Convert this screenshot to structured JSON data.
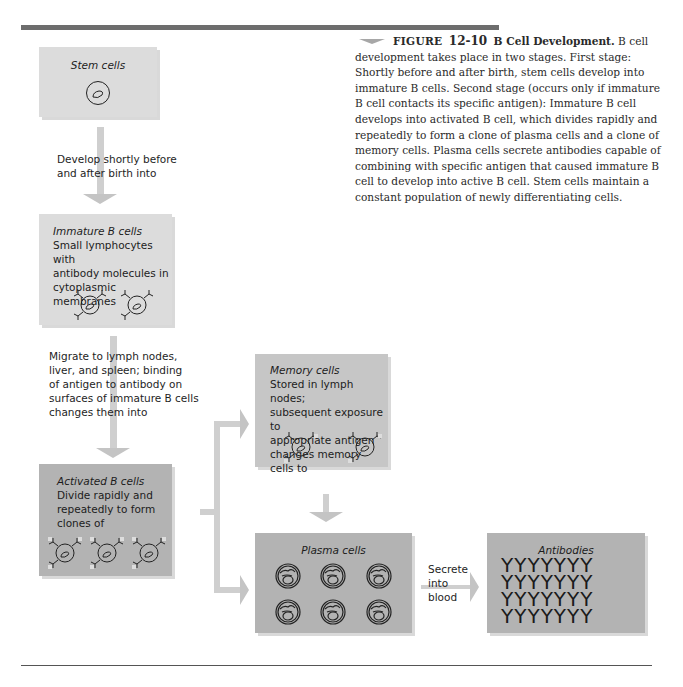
{
  "caption": {
    "figure_label": "FIGURE",
    "figure_number": "12-10",
    "title": "B Cell Development.",
    "body": "B cell development takes place in two stages. First stage: Shortly before and after birth, stem cells develop into immature B cells. Second stage (occurs only if immature B cell contacts its specific antigen): Immature B cell develops into activated B cell, which divides rapidly and repeatedly to form a clone of plasma cells and a clone of memory cells. Plasma cells secrete antibodies capable of combining with specific antigen that caused immature B cell to develop into active B cell. Stem cells maintain a constant population of newly differentiating cells."
  },
  "boxes": {
    "stem": {
      "title": "Stem cells",
      "icon": "stem-cell-icon"
    },
    "immature": {
      "title": "Immature B cells",
      "lines": [
        "Small lymphocytes with",
        "antibody molecules in",
        "cytoplasmic membranes"
      ],
      "icon": "immature-b-cell-icon",
      "icon_count": 2
    },
    "activated": {
      "title": "Activated B cells",
      "lines": [
        "Divide rapidly and",
        "repeatedly to form",
        "clones of"
      ],
      "icon": "activated-b-cell-icon",
      "icon_count": 3
    },
    "memory": {
      "title": "Memory cells",
      "lines": [
        "Stored in lymph nodes;",
        "subsequent exposure to",
        "appropriate antigen",
        "changes memory cells to"
      ],
      "icon": "memory-cell-icon",
      "icon_count": 2
    },
    "plasma": {
      "title": "Plasma cells",
      "icon": "plasma-cell-icon",
      "icon_count": 6
    },
    "antibodies": {
      "title": "Antibodies",
      "rows": [
        "YYYYYYY",
        "YYYYYYY",
        "YYYYYYY",
        "YYYYYYY"
      ],
      "icon": "antibody-icon"
    }
  },
  "transitions": {
    "stem_to_immature": [
      "Develop shortly before",
      "and after birth into"
    ],
    "immature_to_activated": [
      "Migrate to lymph nodes,",
      "liver, and spleen; binding",
      "of antigen to antibody on",
      "surfaces of immature B cells",
      "changes them into"
    ],
    "plasma_to_antibodies": [
      "Secrete",
      "into",
      "blood"
    ]
  },
  "colors": {
    "rule": "#6d6d6d",
    "box_light": "#dcdcdc",
    "box_mid": "#c6c6c6",
    "box_dark": "#b3b3b3",
    "connector": "#cfcfcf"
  }
}
